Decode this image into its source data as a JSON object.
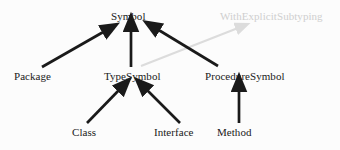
{
  "diagram": {
    "background_color": "#fcfcfc",
    "edge_color": "#1a1a1a",
    "muted_edge_color": "#dcdcdc",
    "text_color": "#202020",
    "muted_text_color": "#cfcfcf",
    "nodes": [
      {
        "id": "symbol",
        "label": "Symbol",
        "style": "normal",
        "x": 111,
        "y": 10
      },
      {
        "id": "withexplicit",
        "label": "WithExplicitSubtyping",
        "style": "muted",
        "x": 220,
        "y": 10
      },
      {
        "id": "package",
        "label": "Package",
        "style": "normal",
        "x": 14,
        "y": 70
      },
      {
        "id": "typesymbol",
        "label": "TypeSymbol",
        "style": "normal",
        "x": 104,
        "y": 70
      },
      {
        "id": "proceduresymbol",
        "label": "ProcedureSymbol",
        "style": "normal",
        "x": 205,
        "y": 70
      },
      {
        "id": "class",
        "label": "Class",
        "style": "normal",
        "x": 72,
        "y": 126
      },
      {
        "id": "interface",
        "label": "Interface",
        "style": "normal",
        "x": 154,
        "y": 126
      },
      {
        "id": "method",
        "label": "Method",
        "style": "normal",
        "x": 217,
        "y": 126
      }
    ],
    "edges": [
      {
        "id": "package-to-symbol",
        "from": "package",
        "to": "symbol",
        "style": "solid"
      },
      {
        "id": "typesymbol-to-symbol",
        "from": "typesymbol",
        "to": "symbol",
        "style": "solid"
      },
      {
        "id": "proceduresymbol-to-symbol",
        "from": "proceduresymbol",
        "to": "symbol",
        "style": "solid"
      },
      {
        "id": "class-to-typesymbol",
        "from": "class",
        "to": "typesymbol",
        "style": "solid"
      },
      {
        "id": "interface-to-typesymbol",
        "from": "interface",
        "to": "typesymbol",
        "style": "solid"
      },
      {
        "id": "method-to-proceduresymbol",
        "from": "method",
        "to": "proceduresymbol",
        "style": "solid"
      },
      {
        "id": "typesymbol-to-withexplicit",
        "from": "typesymbol",
        "to": "withexplicit",
        "style": "muted"
      }
    ]
  }
}
